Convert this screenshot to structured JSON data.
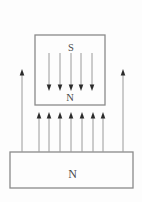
{
  "diagram": {
    "title_semantic": "magnetic-attraction-field-diagram",
    "background_color": "#fdfdfd",
    "outline_color": "#8a8a8a",
    "arrow_shaft_color": "#9a9a9a",
    "arrowhead_color": "#2b2b2b",
    "label_color": "#4a4a4a",
    "top_magnet": {
      "label_top": "S",
      "label_bottom": "N",
      "x": 35,
      "y": 35,
      "width": 70,
      "height": 70
    },
    "bottom_magnet": {
      "label": "N",
      "x": 10,
      "y": 152,
      "width": 123,
      "height": 36
    },
    "field_arrows": [
      {
        "name": "inside-top-magnet-down-arrows",
        "direction": "down",
        "xs": [
          49,
          60,
          71,
          81,
          92
        ],
        "tail_y": 53,
        "tip_y": 91
      },
      {
        "name": "gap-up-arrows",
        "direction": "up",
        "xs": [
          39,
          49,
          60,
          71,
          82,
          93,
          103
        ],
        "tail_y": 152,
        "tip_y": 112
      },
      {
        "name": "outer-up-arrows",
        "direction": "up",
        "xs": [
          22,
          123
        ],
        "tail_y": 152,
        "tip_y": 69
      }
    ],
    "arrow_head_length": 6.5,
    "arrow_head_width": 4.6
  }
}
